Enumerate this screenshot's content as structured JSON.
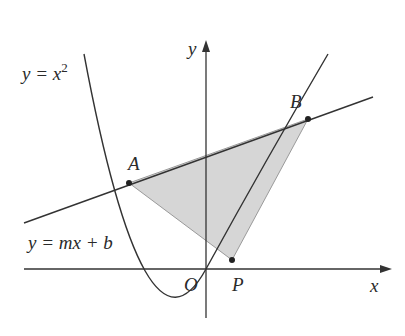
{
  "diagram": {
    "colors": {
      "stroke": "#333333",
      "shade": "#d6d6d6",
      "background": "#ffffff"
    },
    "labels": {
      "parabola": "y = x",
      "parabola_exp": "2",
      "line": "y = mx + b",
      "y_axis": "y",
      "x_axis": "x",
      "origin": "O",
      "point_a": "A",
      "point_b": "B",
      "point_p": "P"
    }
  }
}
